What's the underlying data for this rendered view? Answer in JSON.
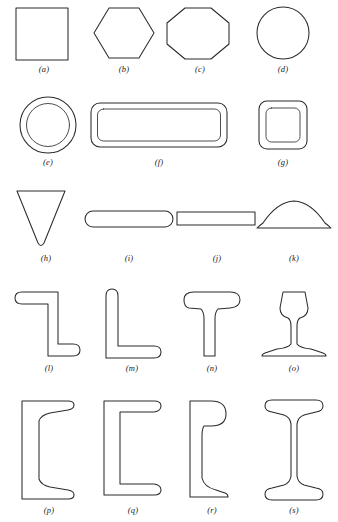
{
  "figure": {
    "caption_style": "italic-letter-in-parentheses",
    "stroke_color": "#2b2b2b",
    "background_color": "#ffffff",
    "rows": 5,
    "items": [
      {
        "key": "a",
        "label": "(a)",
        "name": "solid-square-section",
        "shape": "square"
      },
      {
        "key": "b",
        "label": "(b)",
        "name": "solid-hexagon-section",
        "shape": "hexagon"
      },
      {
        "key": "c",
        "label": "(c)",
        "name": "solid-octagon-section",
        "shape": "octagon"
      },
      {
        "key": "d",
        "label": "(d)",
        "name": "solid-circle-section",
        "shape": "circle"
      },
      {
        "key": "e",
        "label": "(e)",
        "name": "hollow-circular-tube-section",
        "shape": "annulus"
      },
      {
        "key": "f",
        "label": "(f)",
        "name": "hollow-rectangular-tube-section",
        "shape": "rect-tube"
      },
      {
        "key": "g",
        "label": "(g)",
        "name": "hollow-square-tube-section",
        "shape": "square-tube"
      },
      {
        "key": "h",
        "label": "(h)",
        "name": "inverted-triangle-section",
        "shape": "triangle"
      },
      {
        "key": "i",
        "label": "(i)",
        "name": "rounded-flat-bar-section",
        "shape": "round-edge-bar"
      },
      {
        "key": "j",
        "label": "(j)",
        "name": "flat-rectangular-bar-section",
        "shape": "flat-bar"
      },
      {
        "key": "k",
        "label": "(k)",
        "name": "half-round-dome-section",
        "shape": "half-round"
      },
      {
        "key": "l",
        "label": "(l)",
        "name": "z-section",
        "shape": "zee"
      },
      {
        "key": "m",
        "label": "(m)",
        "name": "angle-l-section",
        "shape": "angle"
      },
      {
        "key": "n",
        "label": "(n)",
        "name": "tee-section",
        "shape": "tee"
      },
      {
        "key": "o",
        "label": "(o)",
        "name": "railroad-rail-section",
        "shape": "rail"
      },
      {
        "key": "p",
        "label": "(p)",
        "name": "tapered-flange-channel-section",
        "shape": "channel-tapered"
      },
      {
        "key": "q",
        "label": "(q)",
        "name": "parallel-flange-channel-section",
        "shape": "channel-parallel"
      },
      {
        "key": "r",
        "label": "(r)",
        "name": "bulb-flat-section",
        "shape": "bulb-flat"
      },
      {
        "key": "s",
        "label": "(s)",
        "name": "i-beam-wide-flange-section",
        "shape": "i-beam"
      }
    ]
  }
}
